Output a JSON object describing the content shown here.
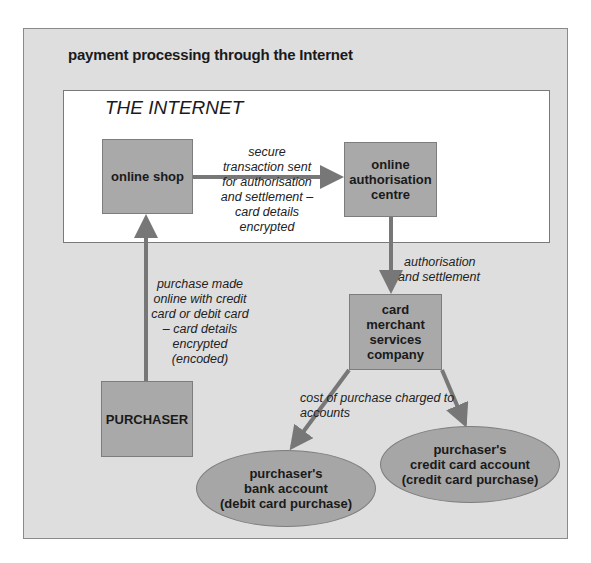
{
  "title": "payment processing through the Internet",
  "internet_label": "THE INTERNET",
  "nodes": {
    "online_shop": "online shop",
    "authorisation_centre": [
      "online",
      "authorisation",
      "centre"
    ],
    "card_merchant": [
      "card",
      "merchant",
      "services",
      "company"
    ],
    "purchaser": "PURCHASER",
    "bank_account": [
      "purchaser's",
      "bank account",
      "(debit card purchase)"
    ],
    "credit_account": [
      "purchaser's",
      "credit card account",
      "(credit card purchase)"
    ]
  },
  "edges": {
    "shop_to_auth": [
      "secure",
      "transaction sent",
      "for authorisation",
      "and settlement –",
      "card details",
      "encrypted"
    ],
    "auth_to_merchant": [
      "authorisation",
      "and settlement"
    ],
    "purchaser_to_shop": [
      "purchase made",
      "online with credit",
      "card or debit card",
      "– card details",
      "encrypted",
      "(encoded)"
    ],
    "merchant_to_accounts": "cost of purchase charged to accounts"
  },
  "colors": {
    "panel": "#dedede",
    "box": "#a9a9a9",
    "arrow": "#777777"
  }
}
